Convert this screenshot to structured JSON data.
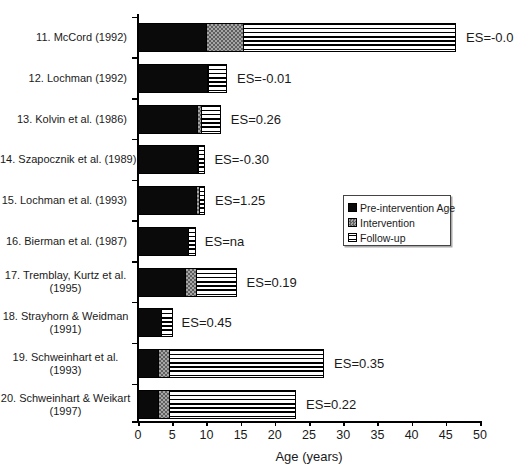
{
  "figure": {
    "background": "#ffffff",
    "axis_color": "#000000"
  },
  "chart_data": {
    "type": "bar",
    "orientation": "horizontal-stacked",
    "title": "",
    "xlabel": "Age (years)",
    "xlim": [
      0,
      50
    ],
    "x_ticks": [
      0,
      5,
      10,
      15,
      20,
      25,
      30,
      35,
      40,
      45,
      50
    ],
    "grid": false,
    "series_names": [
      "Pre-intervention Age",
      "Intervention",
      "Follow-up"
    ],
    "legend": {
      "position": "middle-right",
      "items": [
        {
          "name": "Pre-intervention Age",
          "swatch": "solid-black"
        },
        {
          "name": "Intervention",
          "swatch": "checkered-gray"
        },
        {
          "name": "Follow-up",
          "swatch": "horizontal-stripes"
        }
      ]
    },
    "rows": [
      {
        "label_lines": [
          "11. McCord (1992)"
        ],
        "pre_intervention_age": 10.1,
        "intervention": 5.5,
        "follow_up": 31.2,
        "end_age": 46.8,
        "es_label": "ES=-0.0"
      },
      {
        "label_lines": [
          "12. Lochman (1992)"
        ],
        "pre_intervention_age": 10.3,
        "intervention": 0.3,
        "follow_up": 2.7,
        "end_age": 13.3,
        "es_label": "ES=-0.01"
      },
      {
        "label_lines": [
          "13. Kolvin et al. (1986)"
        ],
        "pre_intervention_age": 8.8,
        "intervention": 0.7,
        "follow_up": 2.9,
        "end_age": 12.4,
        "es_label": "ES=0.26"
      },
      {
        "label_lines": [
          "14. Szapocznik et al. (1989)"
        ],
        "pre_intervention_age": 8.8,
        "intervention": 0.2,
        "follow_up": 1.0,
        "end_age": 10.0,
        "es_label": "ES=-0.30"
      },
      {
        "label_lines": [
          "15. Lochman et al. (1993)"
        ],
        "pre_intervention_age": 8.6,
        "intervention": 0.6,
        "follow_up": 0.9,
        "end_age": 10.1,
        "es_label": "ES=1.25"
      },
      {
        "label_lines": [
          "16. Bierman et al. (1987)"
        ],
        "pre_intervention_age": 7.4,
        "intervention": 0.0,
        "follow_up": 1.2,
        "end_age": 8.6,
        "es_label": "ES=na"
      },
      {
        "label_lines": [
          "17. Tremblay, Kurtz et al.",
          "(1995)"
        ],
        "pre_intervention_age": 7.0,
        "intervention": 1.8,
        "follow_up": 5.9,
        "end_age": 14.7,
        "es_label": "ES=0.19"
      },
      {
        "label_lines": [
          "18. Strayhorn & Weidman",
          "(1991)"
        ],
        "pre_intervention_age": 3.5,
        "intervention": 0.0,
        "follow_up": 1.7,
        "end_age": 5.2,
        "es_label": "ES=0.45"
      },
      {
        "label_lines": [
          "19. Schweinhart et al.",
          "(1993)"
        ],
        "pre_intervention_age": 3.1,
        "intervention": 1.7,
        "follow_up": 22.7,
        "end_age": 27.5,
        "es_label": "ES=0.35"
      },
      {
        "label_lines": [
          "20. Schweinhart & Weikart",
          "(1997)"
        ],
        "pre_intervention_age": 3.1,
        "intervention": 1.7,
        "follow_up": 18.6,
        "end_age": 23.4,
        "es_label": "ES=0.22"
      }
    ],
    "colors": {
      "pre_intervention": "#000000",
      "intervention": "#8c8c8c",
      "follow_up_background": "#ffffff",
      "follow_up_stripe": "#000000"
    }
  }
}
